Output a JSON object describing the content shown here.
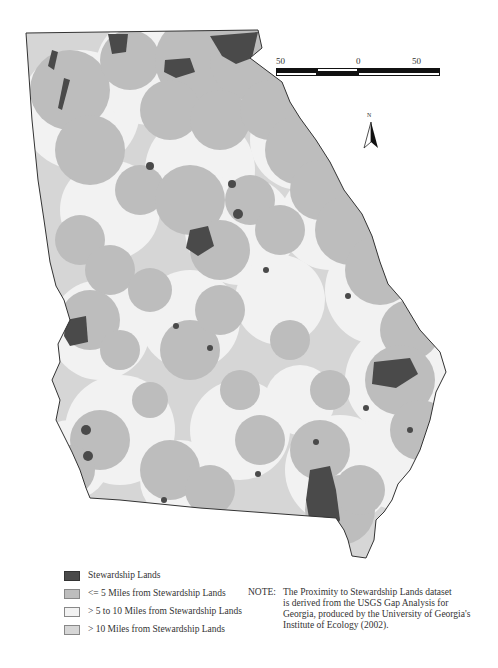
{
  "header": {
    "cropped_title": "MAP AND ANALYSIS"
  },
  "map": {
    "region": "Georgia",
    "colors": {
      "stewardship": "#4a4a4a",
      "within_5": "#bdbdbd",
      "five_to_ten": "#f0f0f0",
      "over_10": "#d9d9d9",
      "outline": "#333333"
    }
  },
  "scale_bar": {
    "left_label": "50",
    "center_label": "0",
    "right_label": "50 Miles"
  },
  "north_arrow": {
    "label": "N"
  },
  "legend": {
    "items": [
      {
        "label": "Stewardship Lands",
        "color": "#4a4a4a"
      },
      {
        "label": "<= 5 Miles from Stewardship Lands",
        "color": "#bdbdbd"
      },
      {
        "label": "> 5 to 10 Miles from Stewardship Lands",
        "color": "#f2f2f2"
      },
      {
        "label": "> 10 Miles from Stewardship Lands",
        "color": "#d6d6d6"
      }
    ]
  },
  "note": {
    "label": "NOTE:",
    "lines": [
      "The Proximity to Stewardship Lands dataset",
      "is derived from the USGS Gap Analysis for",
      "Georgia, produced by the University of Georgia's",
      "Institute of Ecology (2002)."
    ]
  }
}
